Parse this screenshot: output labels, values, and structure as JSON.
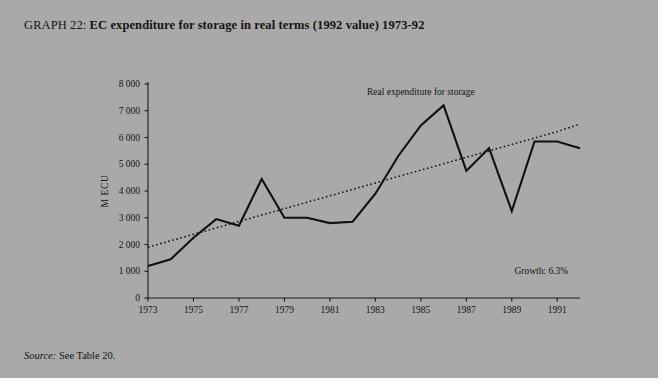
{
  "figure": {
    "label": "GRAPH 22:",
    "title": "EC expenditure for storage in real terms (1992 value) 1973-92",
    "source_label": "Source:",
    "source_text": "See Table 20.",
    "background_color": "#a9a9a9",
    "ink_color": "#101010"
  },
  "chart_data": {
    "type": "line",
    "title": "EC expenditure for storage in real terms (1992 value) 1973-92",
    "xlabel": "",
    "ylabel": "M ECU",
    "xlim": [
      1973,
      1992
    ],
    "ylim": [
      0,
      8000
    ],
    "grid": false,
    "legend_position": "inline-annotation",
    "y_ticks": [
      0,
      1000,
      2000,
      3000,
      4000,
      5000,
      6000,
      7000,
      8000
    ],
    "y_tick_labels": [
      "0",
      "1 000",
      "2 000",
      "3 000",
      "4 000",
      "5 000",
      "6 000",
      "7 000",
      "8 000"
    ],
    "x_ticks": [
      1973,
      1975,
      1977,
      1979,
      1981,
      1983,
      1985,
      1987,
      1989,
      1991
    ],
    "x_tick_labels": [
      "1973",
      "1975",
      "1977",
      "1979",
      "1981",
      "1983",
      "1985",
      "1987",
      "1989",
      "1991"
    ],
    "x": [
      1973,
      1974,
      1975,
      1976,
      1977,
      1978,
      1979,
      1980,
      1981,
      1982,
      1983,
      1984,
      1985,
      1986,
      1987,
      1988,
      1989,
      1990,
      1991,
      1992
    ],
    "series": [
      {
        "name": "Real expenditure for storage",
        "style": "solid",
        "color": "#101010",
        "values": [
          1200,
          1450,
          2250,
          2950,
          2700,
          4450,
          3000,
          3000,
          2800,
          2850,
          3900,
          5300,
          6450,
          7200,
          4750,
          5600,
          3250,
          5850,
          5850,
          5600
        ]
      },
      {
        "name": "Trend",
        "style": "dotted",
        "color": "#101010",
        "values": [
          1900,
          2140,
          2380,
          2620,
          2860,
          3100,
          3340,
          3580,
          3820,
          4060,
          4300,
          4540,
          4780,
          5020,
          5260,
          5500,
          5740,
          5980,
          6220,
          6500
        ]
      }
    ],
    "annotations": [
      {
        "name": "series-label",
        "text": "Real expenditure for storage",
        "x": 1985,
        "y": 7600
      },
      {
        "name": "growth-label",
        "text": "Growth: 6.3%",
        "x": 1990.3,
        "y": 900
      }
    ]
  }
}
